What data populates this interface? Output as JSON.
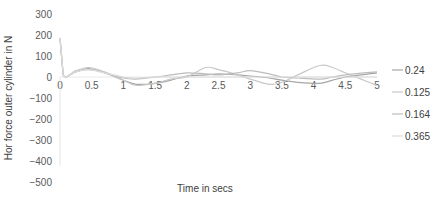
{
  "chart_data": {
    "type": "line",
    "title": "",
    "xlabel": "Time in secs",
    "ylabel": "Hor force outer cylinder in N",
    "xlim": [
      0,
      5
    ],
    "ylim": [
      -500,
      300
    ],
    "x_ticks": [
      "0",
      "0.5",
      "1",
      "1.5",
      "2",
      "2.5",
      "3",
      "3.5",
      "4",
      "4.5",
      "5"
    ],
    "y_ticks": [
      "300",
      "200",
      "100",
      "0",
      "−100",
      "−200",
      "−300",
      "−400",
      "−500"
    ],
    "grid": false,
    "legend_position": "right",
    "x": [
      0,
      0.05,
      0.25,
      0.45,
      0.7,
      1.0,
      1.2,
      1.5,
      1.75,
      2.0,
      2.3,
      2.5,
      2.8,
      3.0,
      3.3,
      3.5,
      3.75,
      4.1,
      4.3,
      4.5,
      4.75,
      5.0
    ],
    "series": [
      {
        "name": "0.24",
        "color": "#a6a6a6",
        "values": [
          185,
          10,
          25,
          40,
          20,
          -15,
          -35,
          -30,
          -15,
          5,
          10,
          15,
          10,
          5,
          -5,
          -15,
          -25,
          -30,
          -15,
          0,
          10,
          20
        ]
      },
      {
        "name": "0.125",
        "color": "#c8c8c8",
        "values": [
          185,
          10,
          30,
          45,
          25,
          -15,
          -40,
          -30,
          -10,
          0,
          45,
          35,
          10,
          -10,
          -35,
          -25,
          10,
          55,
          45,
          20,
          -10,
          -40
        ]
      },
      {
        "name": "0.164",
        "color": "#bdbdbd",
        "values": [
          185,
          10,
          25,
          35,
          20,
          -5,
          -10,
          0,
          10,
          20,
          15,
          10,
          20,
          30,
          15,
          0,
          -5,
          -10,
          0,
          10,
          18,
          25
        ]
      },
      {
        "name": "0.365",
        "color": "#dcdcdc",
        "values": [
          185,
          10,
          25,
          35,
          20,
          0,
          -5,
          0,
          0,
          0,
          0,
          0,
          0,
          0,
          0,
          0,
          0,
          0,
          0,
          0,
          0,
          0
        ]
      }
    ]
  },
  "legend": {
    "items": [
      {
        "label": "0.24"
      },
      {
        "label": "0.125"
      },
      {
        "label": "0.164"
      },
      {
        "label": "0.365"
      }
    ]
  }
}
